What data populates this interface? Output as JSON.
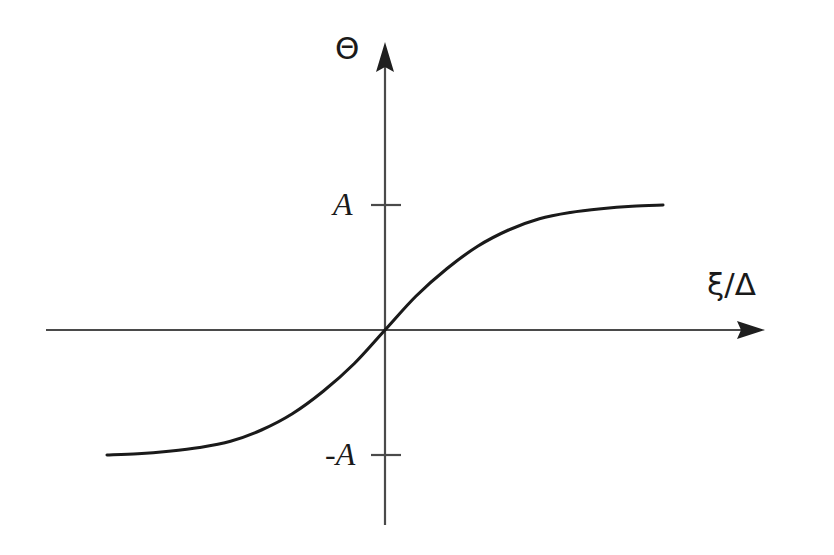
{
  "chart_data": {
    "type": "line",
    "title": "",
    "subtitle": "",
    "xlabel": "ξ/Δ",
    "ylabel": "Θ",
    "legend": [],
    "legend_position": "none",
    "grid": false,
    "axis_style": "centered-cross-with-arrows",
    "xlim": [
      -4.5,
      4.5
    ],
    "ylim": [
      -1.45,
      1.45
    ],
    "xticks": [],
    "xticklabels": [],
    "yticks": [
      1,
      -1
    ],
    "yticklabels": [
      "A",
      "-A"
    ],
    "annotations": [],
    "series": [
      {
        "name": "Θ(ξ/Δ)",
        "description": "odd saturating sigmoid through the origin, asymptotic to +A and -A",
        "x": [
          -4.5,
          -4.0,
          -3.5,
          -3.0,
          -2.5,
          -2.0,
          -1.5,
          -1.0,
          -0.5,
          0.0,
          0.5,
          1.0,
          1.5,
          2.0,
          2.5,
          3.0,
          3.5,
          4.0,
          4.5
        ],
        "y": [
          -1.0,
          -0.99,
          -0.97,
          -0.94,
          -0.89,
          -0.8,
          -0.67,
          -0.49,
          -0.27,
          0.0,
          0.27,
          0.49,
          0.67,
          0.8,
          0.89,
          0.94,
          0.97,
          0.99,
          1.0
        ]
      }
    ]
  },
  "labels": {
    "y_axis": "Θ",
    "x_axis": "ξ/Δ",
    "tick_positive": "A",
    "tick_negative": "-A"
  },
  "colors": {
    "background": "#ffffff",
    "axis": "#3a3a3a",
    "curve": "#1a1a1a",
    "text": "#1a1a1a"
  }
}
